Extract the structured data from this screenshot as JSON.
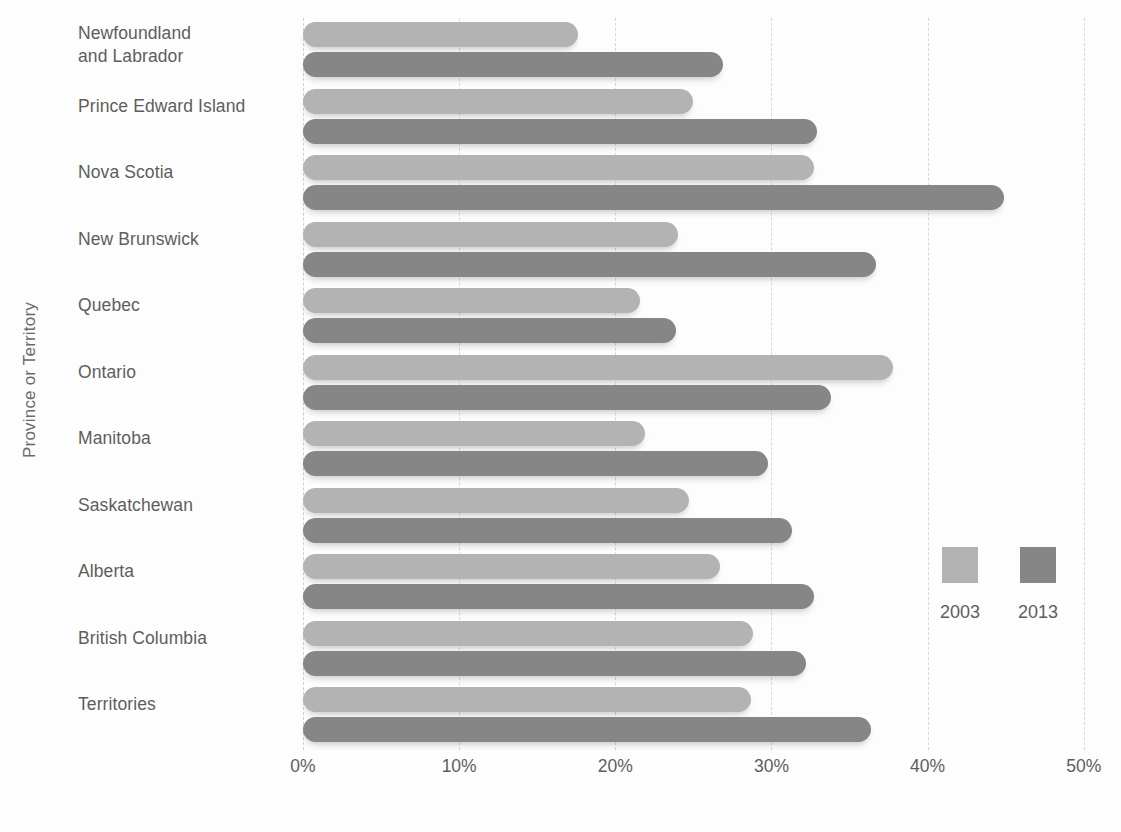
{
  "chart_data": {
    "type": "bar",
    "orientation": "horizontal",
    "title": "",
    "xlabel": "",
    "ylabel": "Province or Territory",
    "xlim": [
      0,
      52
    ],
    "xticks": [
      0,
      10,
      20,
      30,
      40,
      50
    ],
    "xtick_labels": [
      "0%",
      "10%",
      "20%",
      "30%",
      "40%",
      "50%"
    ],
    "grid": true,
    "legend_position": "right",
    "categories": [
      "Newfoundland\nand Labrador",
      "Prince Edward Island",
      "Nova Scotia",
      "New Brunswick",
      "Quebec",
      "Ontario",
      "Manitoba",
      "Saskatchewan",
      "Alberta",
      "British Columbia",
      "Territories"
    ],
    "series": [
      {
        "name": "2003",
        "color": "#b3b3b3",
        "values": [
          17.6,
          25.0,
          32.7,
          24.0,
          21.6,
          37.8,
          21.9,
          24.7,
          26.7,
          28.8,
          28.7
        ]
      },
      {
        "name": "2013",
        "color": "#868686",
        "values": [
          26.9,
          32.9,
          44.9,
          36.7,
          23.9,
          33.8,
          29.8,
          31.3,
          32.7,
          32.2,
          36.4
        ]
      }
    ]
  },
  "axis": {
    "y_title": "Province or Territory",
    "x_ticks": [
      "0%",
      "10%",
      "20%",
      "30%",
      "40%",
      "50%"
    ]
  },
  "categories": [
    {
      "line1": "Newfoundland",
      "line2": "and Labrador"
    },
    {
      "line1": "Prince Edward Island",
      "line2": ""
    },
    {
      "line1": "Nova Scotia",
      "line2": ""
    },
    {
      "line1": "New Brunswick",
      "line2": ""
    },
    {
      "line1": "Quebec",
      "line2": ""
    },
    {
      "line1": "Ontario",
      "line2": ""
    },
    {
      "line1": "Manitoba",
      "line2": ""
    },
    {
      "line1": "Saskatchewan",
      "line2": ""
    },
    {
      "line1": "Alberta",
      "line2": ""
    },
    {
      "line1": "British Columbia",
      "line2": ""
    },
    {
      "line1": "Territories",
      "line2": ""
    }
  ],
  "legend": {
    "items": [
      {
        "label": "2003",
        "color": "#b3b3b3"
      },
      {
        "label": "2013",
        "color": "#868686"
      }
    ]
  },
  "colors": {
    "series_2003": "#b3b3b3",
    "series_2013": "#868686",
    "grid": "#d8d8d8",
    "text": "#5d5d5d",
    "background": "#fdfdfd"
  }
}
